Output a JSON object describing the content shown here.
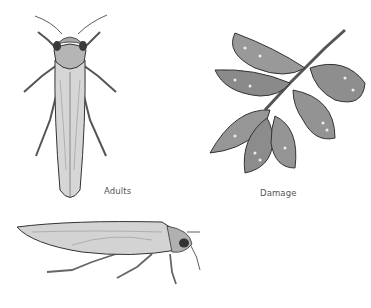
{
  "figures": [
    {
      "id": "adult-dorsal",
      "caption": "Adults"
    },
    {
      "id": "leaf-damage",
      "caption": "Damage"
    },
    {
      "id": "adult-lateral",
      "caption": ""
    }
  ],
  "colors": {
    "ink": "#2e2e2e",
    "body_fill": "#cfcfcf",
    "leaf_fill": "#8f8f8f",
    "background": "#ffffff"
  }
}
